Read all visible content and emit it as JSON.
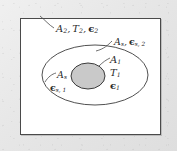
{
  "figure": {
    "type": "technical-diagram",
    "frame_color": "#e9e9e9",
    "panel_color": "#ffffff",
    "panel_border_color": "#4a4a4a",
    "line_color": "#3c3c3c",
    "inner_body_fill": "#c9c9c9",
    "text_color": "#2a2a2a"
  },
  "shapes": {
    "outer_ellipse": {
      "name": "outer-enclosure-ellipse",
      "cx": 95,
      "cy": 75,
      "rx": 53,
      "ry": 30
    },
    "inner_ellipse": {
      "name": "inner-body-ellipse",
      "cx": 88,
      "cy": 76,
      "rx": 17,
      "ry": 13
    }
  },
  "labels": {
    "outer_surface": {
      "name": "outer-surface-label",
      "area": "A",
      "area_sub": "2",
      "temperature": "T",
      "temperature_sub": "2",
      "emissivity": "ϵ",
      "emissivity_sub": "2",
      "comma": ","
    },
    "shield_outer": {
      "name": "shield-outer-side-label",
      "area": "A",
      "area_sub": "s",
      "emissivity": "ϵ",
      "emissivity_sub": "s, 2",
      "comma": ","
    },
    "inner_surface": {
      "name": "inner-surface-label",
      "area": "A",
      "area_sub": "1",
      "temperature": "T",
      "temperature_sub": "1",
      "emissivity": "ϵ",
      "emissivity_sub": "1"
    },
    "shield_inner": {
      "name": "shield-inner-side-label",
      "area": "A",
      "area_sub": "s",
      "emissivity": "ϵ",
      "emissivity_sub": "s, 1"
    }
  }
}
